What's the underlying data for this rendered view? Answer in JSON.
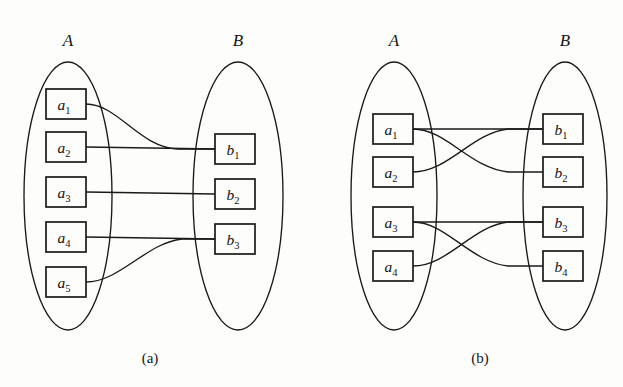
{
  "figure": {
    "background_color": "#fdfdfc",
    "stroke_color": "#1a1a1a",
    "width": 623,
    "height": 387
  },
  "panels": [
    {
      "id": "a",
      "caption": "(a)",
      "caption_pos": {
        "x": 150,
        "y": 363
      },
      "sets": [
        {
          "name": "A",
          "label_pos": {
            "x": 68,
            "y": 46
          },
          "ellipse": {
            "cx": 68,
            "cy": 196,
            "rx": 44,
            "ry": 134
          },
          "nodes": [
            {
              "label": "a",
              "sub": "1",
              "x": 46,
              "y": 89,
              "w": 40,
              "h": 30
            },
            {
              "label": "a",
              "sub": "2",
              "x": 46,
              "y": 132,
              "w": 40,
              "h": 30
            },
            {
              "label": "a",
              "sub": "3",
              "x": 46,
              "y": 177,
              "w": 40,
              "h": 30
            },
            {
              "label": "a",
              "sub": "4",
              "x": 46,
              "y": 222,
              "w": 40,
              "h": 30
            },
            {
              "label": "a",
              "sub": "5",
              "x": 46,
              "y": 267,
              "w": 40,
              "h": 30
            }
          ]
        },
        {
          "name": "B",
          "label_pos": {
            "x": 238,
            "y": 46
          },
          "ellipse": {
            "cx": 238,
            "cy": 196,
            "rx": 45,
            "ry": 134
          },
          "nodes": [
            {
              "label": "b",
              "sub": "1",
              "x": 215,
              "y": 134,
              "w": 40,
              "h": 30
            },
            {
              "label": "b",
              "sub": "2",
              "x": 215,
              "y": 179,
              "w": 40,
              "h": 30
            },
            {
              "label": "b",
              "sub": "3",
              "x": 215,
              "y": 224,
              "w": 40,
              "h": 30
            }
          ]
        }
      ],
      "edges": [
        {
          "from": "a1",
          "to": "b1",
          "kind": "curve"
        },
        {
          "from": "a2",
          "to": "b1",
          "kind": "straight"
        },
        {
          "from": "a3",
          "to": "b2",
          "kind": "straight"
        },
        {
          "from": "a4",
          "to": "b3",
          "kind": "straight"
        },
        {
          "from": "a5",
          "to": "b3",
          "kind": "curve"
        }
      ]
    },
    {
      "id": "b",
      "caption": "(b)",
      "caption_pos": {
        "x": 480,
        "y": 363
      },
      "sets": [
        {
          "name": "A",
          "label_pos": {
            "x": 394,
            "y": 46
          },
          "ellipse": {
            "cx": 394,
            "cy": 196,
            "rx": 43,
            "ry": 134
          },
          "nodes": [
            {
              "label": "a",
              "sub": "1",
              "x": 373,
              "y": 114,
              "w": 40,
              "h": 30
            },
            {
              "label": "a",
              "sub": "2",
              "x": 373,
              "y": 157,
              "w": 40,
              "h": 30
            },
            {
              "label": "a",
              "sub": "3",
              "x": 373,
              "y": 207,
              "w": 40,
              "h": 30
            },
            {
              "label": "a",
              "sub": "4",
              "x": 373,
              "y": 251,
              "w": 40,
              "h": 30
            }
          ]
        },
        {
          "name": "B",
          "label_pos": {
            "x": 565,
            "y": 46
          },
          "ellipse": {
            "cx": 565,
            "cy": 196,
            "rx": 42,
            "ry": 134
          },
          "nodes": [
            {
              "label": "b",
              "sub": "1",
              "x": 543,
              "y": 114,
              "w": 40,
              "h": 30
            },
            {
              "label": "b",
              "sub": "2",
              "x": 543,
              "y": 157,
              "w": 40,
              "h": 30
            },
            {
              "label": "b",
              "sub": "3",
              "x": 543,
              "y": 207,
              "w": 40,
              "h": 30
            },
            {
              "label": "b",
              "sub": "4",
              "x": 543,
              "y": 251,
              "w": 40,
              "h": 30
            }
          ]
        }
      ],
      "edges": [
        {
          "from": "a1",
          "to": "b1",
          "kind": "straight"
        },
        {
          "from": "a1",
          "to": "b2",
          "kind": "curve"
        },
        {
          "from": "a2",
          "to": "b1",
          "kind": "curve"
        },
        {
          "from": "a3",
          "to": "b3",
          "kind": "straight"
        },
        {
          "from": "a3",
          "to": "b4",
          "kind": "curve"
        },
        {
          "from": "a4",
          "to": "b3",
          "kind": "curve"
        }
      ]
    }
  ]
}
